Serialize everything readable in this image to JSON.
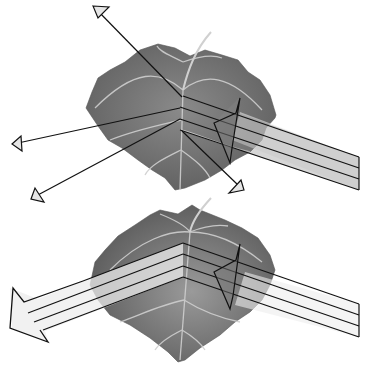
{
  "diagram": {
    "colors": {
      "background": "#ffffff",
      "leaf_fill": "#7a7a7a",
      "leaf_dark": "#5e5e5e",
      "leaf_vein": "#d8d8d8",
      "beam_fill": "#ececec",
      "outline": "#111111"
    },
    "panels": [
      {
        "name": "diffuse-reflection",
        "incident_beam": {
          "direction": "from right",
          "lines": 3
        },
        "reflected_rays": [
          "up-left",
          "left",
          "down-left",
          "down-right"
        ]
      },
      {
        "name": "specular-reflection",
        "incident_beam": {
          "direction": "from right",
          "lines": 3
        },
        "reflected_beam": {
          "direction": "to left",
          "lines": 3
        }
      }
    ]
  }
}
